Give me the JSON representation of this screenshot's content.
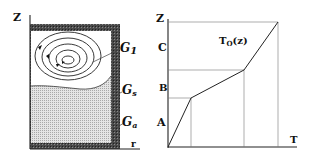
{
  "left_panel": {
    "axis_vertical_label": "Z",
    "axis_horizontal_label": "r",
    "regions": [
      {
        "id": "g1",
        "label_main": "G",
        "label_sub": "1",
        "description": "upper fluid region with circulating flow (concentric loops)"
      },
      {
        "id": "gs",
        "label_main": "G",
        "label_sub": "s",
        "description": "interface / mushy layer"
      },
      {
        "id": "ga",
        "label_main": "G",
        "label_sub": "a",
        "description": "lower stippled region"
      }
    ],
    "colors": {
      "wall": "#3a3a3a",
      "stipple": "#c8c8c8",
      "fluid": "#ffffff"
    }
  },
  "right_panel": {
    "axis_vertical_label": "Z",
    "axis_horizontal_label": "T",
    "curve_label_main": "T",
    "curve_label_sub": "O",
    "curve_label_arg": "(z)",
    "zone_labels": [
      "A",
      "B",
      "C"
    ]
  }
}
